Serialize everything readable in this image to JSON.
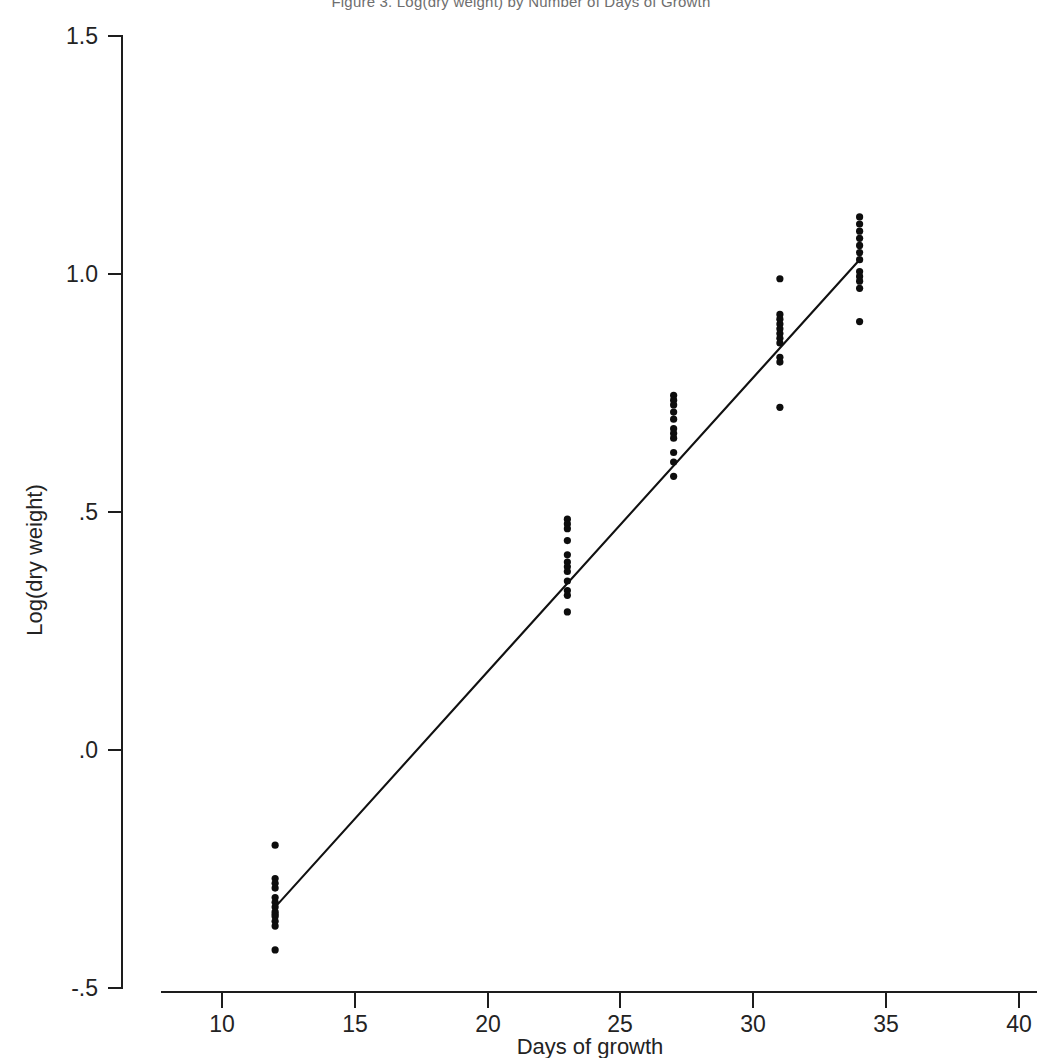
{
  "figure": {
    "title": "Figure 3. Log(dry weight) by Number of Days of Growth",
    "background_color": "#ffffff",
    "point_color": "#0d0d0d",
    "line_color": "#111111",
    "axis_color": "#1d1d1d"
  },
  "chart_data": {
    "type": "scatter",
    "title": "Figure 3. Log(dry weight) by Number of Days of Growth",
    "xlabel": "Days of growth",
    "ylabel": "Log(dry weight)",
    "xlim": [
      8.5,
      40
    ],
    "ylim": [
      -0.5,
      1.5
    ],
    "xticks": [
      10,
      15,
      20,
      25,
      30,
      35,
      40
    ],
    "xtick_labels": [
      "10",
      "15",
      "20",
      "25",
      "30",
      "35",
      "40"
    ],
    "yticks": [
      -0.5,
      0.0,
      0.5,
      1.0,
      1.5
    ],
    "ytick_labels": [
      "-.5",
      ".0",
      ".5",
      "1.0",
      "1.5"
    ],
    "grid": false,
    "legend": false,
    "series": [
      {
        "name": "observations",
        "marker": "dot",
        "x": [
          12,
          12,
          12,
          12,
          12,
          12,
          12,
          12,
          12,
          12,
          12,
          12,
          12,
          23,
          23,
          23,
          23,
          23,
          23,
          23,
          23,
          23,
          23,
          23,
          23,
          27,
          27,
          27,
          27,
          27,
          27,
          27,
          27,
          27,
          27,
          27,
          31,
          31,
          31,
          31,
          31,
          31,
          31,
          31,
          31,
          31,
          31,
          34,
          34,
          34,
          34,
          34,
          34,
          34,
          34,
          34,
          34,
          34,
          34
        ],
        "y": [
          -0.2,
          -0.27,
          -0.28,
          -0.29,
          -0.31,
          -0.32,
          -0.33,
          -0.34,
          -0.345,
          -0.35,
          -0.36,
          -0.37,
          -0.42,
          0.485,
          0.475,
          0.465,
          0.44,
          0.41,
          0.395,
          0.385,
          0.375,
          0.355,
          0.335,
          0.325,
          0.29,
          0.745,
          0.735,
          0.725,
          0.71,
          0.695,
          0.675,
          0.665,
          0.655,
          0.625,
          0.605,
          0.575,
          0.99,
          0.915,
          0.905,
          0.895,
          0.885,
          0.875,
          0.865,
          0.855,
          0.825,
          0.815,
          0.72,
          1.12,
          1.105,
          1.09,
          1.075,
          1.06,
          1.045,
          1.03,
          1.005,
          0.995,
          0.985,
          0.97,
          0.9
        ]
      }
    ],
    "fit_line": {
      "name": "fitted line",
      "x": [
        12,
        34
      ],
      "y": [
        -0.33,
        1.03
      ]
    }
  }
}
